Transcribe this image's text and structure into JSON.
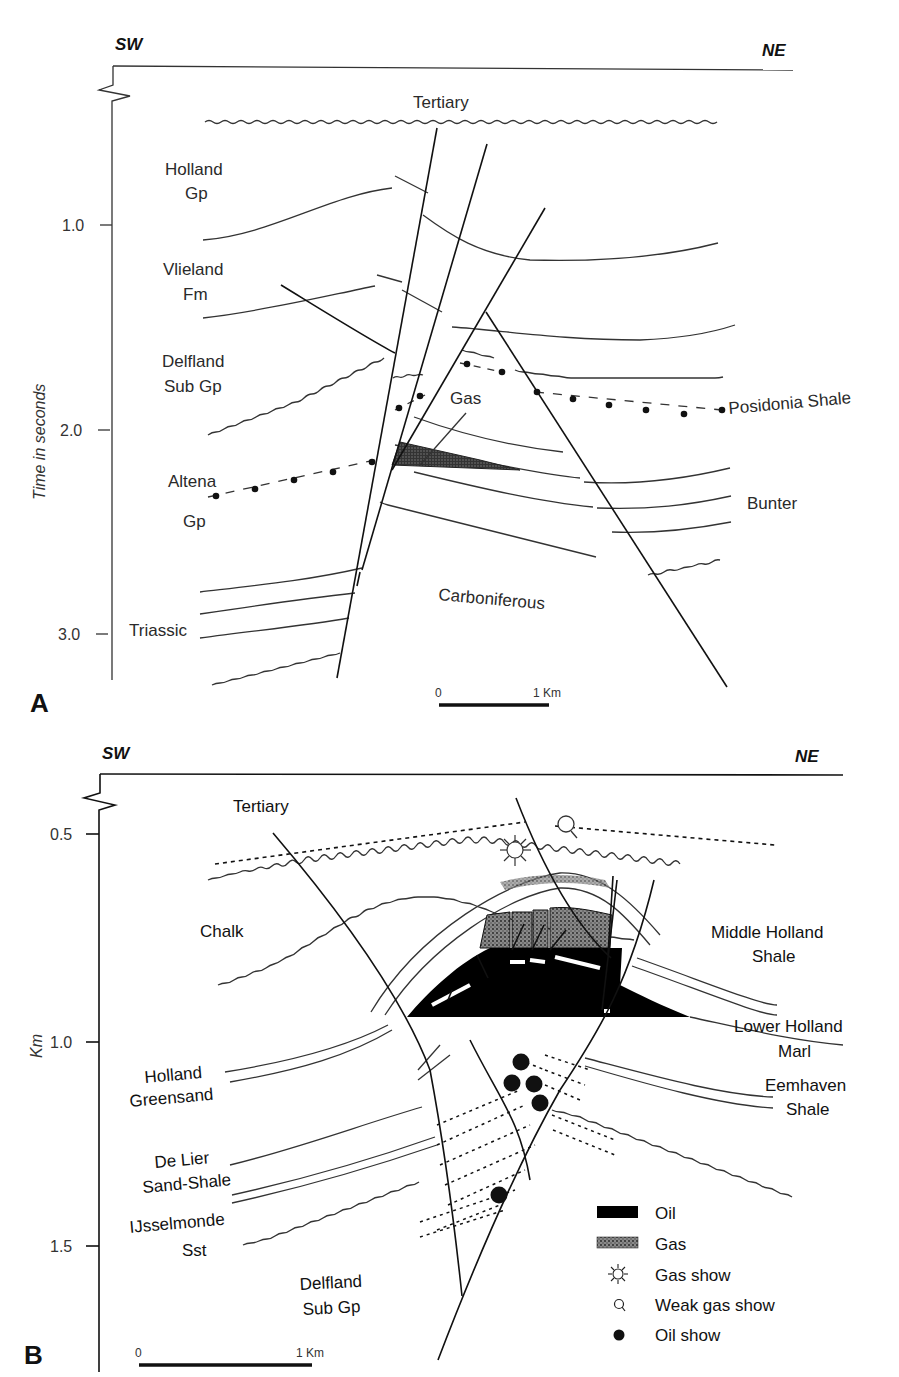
{
  "header": {
    "page_fragment": "...lleys  323"
  },
  "panel_a": {
    "panel_label": "A",
    "direction_left": "SW",
    "direction_right": "NE",
    "y_axis_title": "Time in seconds",
    "y_ticks": [
      "1.0",
      "2.0",
      "3.0"
    ],
    "units": [
      {
        "line1": "Tertiary",
        "line2": ""
      },
      {
        "line1": "Holland",
        "line2": "Gp"
      },
      {
        "line1": "Vlieland",
        "line2": "Fm"
      },
      {
        "line1": "Delfland",
        "line2": "Sub Gp"
      },
      {
        "line1": "Altena",
        "line2": "Gp"
      },
      {
        "line1": "Triassic",
        "line2": ""
      },
      {
        "line1": "Carboniferous",
        "line2": ""
      },
      {
        "line1": "Bunter",
        "line2": ""
      },
      {
        "line1": "Posidonia Shale",
        "line2": ""
      },
      {
        "line1": "Gas",
        "line2": ""
      }
    ],
    "scale_bar": {
      "start": "0",
      "end": "1 Km"
    }
  },
  "panel_b": {
    "panel_label": "B",
    "direction_left": "SW",
    "direction_right": "NE",
    "y_axis_title": "Km",
    "y_ticks": [
      "0.5",
      "1.0",
      "1.5"
    ],
    "units": [
      {
        "line1": "Tertiary",
        "line2": ""
      },
      {
        "line1": "Chalk",
        "line2": ""
      },
      {
        "line1": "Middle Holland",
        "line2": "Shale"
      },
      {
        "line1": "Lower Holland",
        "line2": "Marl"
      },
      {
        "line1": "Eemhaven",
        "line2": "Shale"
      },
      {
        "line1": "Holland",
        "line2": "Greensand"
      },
      {
        "line1": "De Lier",
        "line2": "Sand-Shale"
      },
      {
        "line1": "IJsselmonde",
        "line2": "Sst"
      },
      {
        "line1": "Delfland",
        "line2": "Sub Gp"
      }
    ],
    "scale_bar": {
      "start": "0",
      "end": "1 Km"
    },
    "legend": [
      {
        "label": "Oil",
        "icon": "oil-fill-swatch"
      },
      {
        "label": "Gas",
        "icon": "gas-stipple-swatch"
      },
      {
        "label": "Gas show",
        "icon": "sun-burst-icon"
      },
      {
        "label": "Weak gas show",
        "icon": "magnifier-circle-icon"
      },
      {
        "label": "Oil show",
        "icon": "filled-dot-icon"
      }
    ]
  },
  "colors": {
    "ink": "#1a1a1a",
    "gas_fill": "#6a6a6a",
    "oil_fill": "#000000",
    "paper": "#ffffff"
  }
}
